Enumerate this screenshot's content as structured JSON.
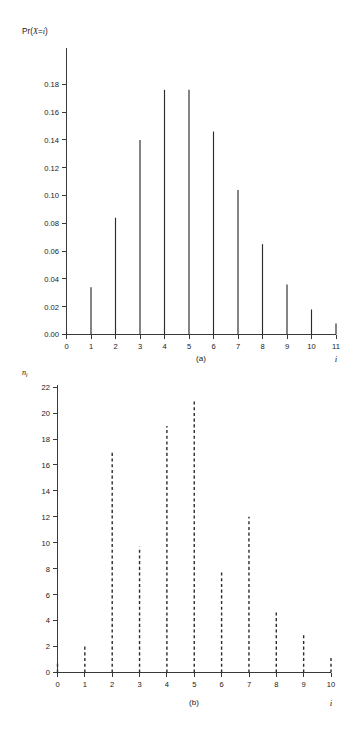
{
  "figure": {
    "background_color": "#ffffff",
    "line_color": "#2b2b2b",
    "axis_color": "#3a3a3a"
  },
  "panel_a": {
    "caption": "(a)",
    "ylabel_prefix": "Pr(",
    "ylabel_var": "X",
    "ylabel_eq": "=",
    "ylabel_index": "i",
    "ylabel_suffix": ")",
    "xlabel": "i",
    "y_ticks": [
      "0.00",
      "0.02",
      "0.04",
      "0.06",
      "0.08",
      "0.10",
      "0.12",
      "0.14",
      "0.16",
      "0.18"
    ],
    "x_ticks": [
      "0",
      "1",
      "2",
      "3",
      "4",
      "5",
      "6",
      "7",
      "8",
      "9",
      "10",
      "11"
    ]
  },
  "panel_b": {
    "caption": "(b)",
    "ylabel_base": "n",
    "ylabel_sub": "i",
    "xlabel": "i",
    "y_ticks": [
      "0",
      "2",
      "4",
      "6",
      "8",
      "10",
      "12",
      "14",
      "16",
      "18",
      "20",
      "22"
    ],
    "x_ticks": [
      "0",
      "1",
      "2",
      "3",
      "4",
      "5",
      "6",
      "7",
      "8",
      "9",
      "10"
    ]
  },
  "chart_data": [
    {
      "type": "bar",
      "panel": "(a)",
      "style": "stem/spike, solid thin vertical lines",
      "title": "",
      "xlabel": "i",
      "ylabel": "Pr(X = i)",
      "x": [
        0,
        1,
        2,
        3,
        4,
        5,
        6,
        7,
        8,
        9,
        10,
        11
      ],
      "categories": [
        "0",
        "1",
        "2",
        "3",
        "4",
        "5",
        "6",
        "7",
        "8",
        "9",
        "10",
        "11"
      ],
      "values": [
        0.002,
        0.034,
        0.084,
        0.14,
        0.176,
        0.176,
        0.146,
        0.104,
        0.065,
        0.036,
        0.018,
        0.008
      ],
      "xlim": [
        0,
        11
      ],
      "ylim": [
        0.0,
        0.18
      ],
      "ytick_step": 0.02,
      "xtick_step": 1,
      "grid": false,
      "legend": null
    },
    {
      "type": "bar",
      "panel": "(b)",
      "style": "stem/spike, dashed vertical lines",
      "title": "",
      "xlabel": "i",
      "ylabel": "n_i",
      "x": [
        0,
        1,
        2,
        3,
        4,
        5,
        6,
        7,
        8,
        9,
        10
      ],
      "categories": [
        "0",
        "1",
        "2",
        "3",
        "4",
        "5",
        "6",
        "7",
        "8",
        "9",
        "10"
      ],
      "values": [
        0.7,
        2,
        17,
        9.7,
        19,
        21,
        7.8,
        12,
        4.8,
        3,
        1.3
      ],
      "xlim": [
        0,
        10
      ],
      "ylim": [
        0,
        22
      ],
      "ytick_step": 2,
      "xtick_step": 1,
      "grid": false,
      "legend": null
    }
  ]
}
